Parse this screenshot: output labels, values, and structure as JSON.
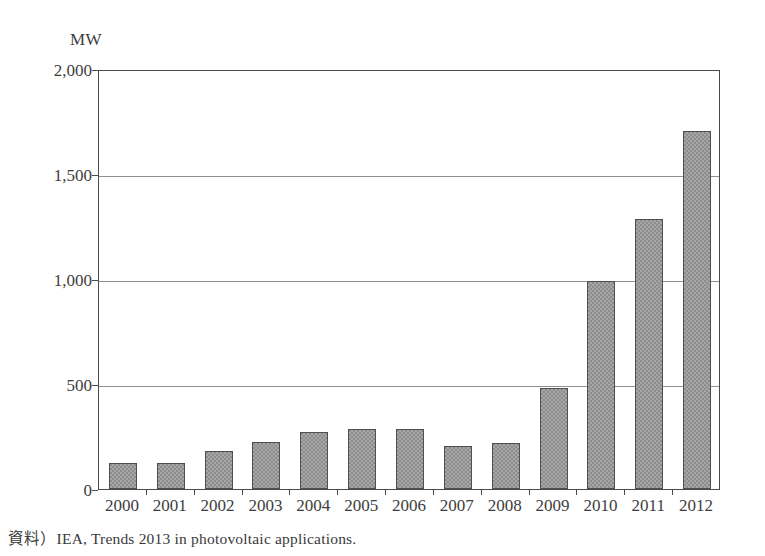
{
  "chart_data": {
    "type": "bar",
    "title": "",
    "subtitle": "",
    "xlabel": "",
    "ylabel": "MW",
    "unit_label": "MW",
    "categories": [
      "2000",
      "2001",
      "2002",
      "2003",
      "2004",
      "2005",
      "2006",
      "2007",
      "2008",
      "2009",
      "2010",
      "2011",
      "2012"
    ],
    "values": [
      125,
      125,
      180,
      222,
      270,
      285,
      285,
      205,
      220,
      480,
      990,
      1285,
      1705
    ],
    "ylim": [
      0,
      2000
    ],
    "y_ticks": [
      0,
      500,
      1000,
      1500,
      2000
    ],
    "y_tick_labels": [
      "0",
      "500",
      "1,000",
      "1,500",
      "2,000"
    ],
    "grid": true,
    "grid_axis": "y",
    "legend": false,
    "legend_position": "none",
    "bar_color": "#8d8d8d",
    "bar_edge_color": "#4f4f4f",
    "axis_color": "#4a4a4a",
    "gridline_color": "#909090",
    "text_color": "#3d3d3d",
    "series": [
      {
        "name": "Annual installed PV capacity",
        "values": [
          125,
          125,
          180,
          222,
          270,
          285,
          285,
          205,
          220,
          480,
          990,
          1285,
          1705
        ]
      }
    ]
  },
  "source": {
    "note": "資料）IEA, Trends 2013 in photovoltaic applications."
  }
}
